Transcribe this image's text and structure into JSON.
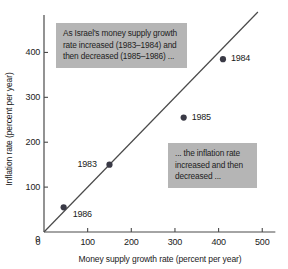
{
  "chart_data": {
    "type": "scatter",
    "title": "",
    "xlabel": "Money supply growth rate (percent per year)",
    "ylabel": "Inflation rate (percent per year)",
    "xlim": [
      0,
      530
    ],
    "ylim": [
      0,
      470
    ],
    "xticks": [
      "0",
      "100",
      "200",
      "300",
      "400",
      "500"
    ],
    "xtick_values": [
      0,
      100,
      200,
      300,
      400,
      500
    ],
    "yticks": [
      "0",
      "100",
      "200",
      "300",
      "400"
    ],
    "ytick_values": [
      0,
      100,
      200,
      300,
      400
    ],
    "grid": false,
    "legend": "none",
    "reference_line": {
      "name": "45-degree line",
      "from": [
        0,
        0
      ],
      "to": [
        490,
        490
      ]
    },
    "points": [
      {
        "label": "1986",
        "x": 45,
        "y": 55,
        "label_dx": 9,
        "label_dy": 8
      },
      {
        "label": "1983",
        "x": 150,
        "y": 150,
        "label_dx": -32,
        "label_dy": 0
      },
      {
        "label": "1985",
        "x": 320,
        "y": 255,
        "label_dx": 8,
        "label_dy": 0
      },
      {
        "label": "1984",
        "x": 410,
        "y": 385,
        "label_dx": 8,
        "label_dy": 0
      }
    ],
    "annotations": [
      {
        "name": "callout-money-supply",
        "text": "As Israel's money supply growth rate increased (1983–1984) and then decreased (1985–1986) ..."
      },
      {
        "name": "callout-inflation",
        "text": "... the inflation rate increased and then decreased ..."
      }
    ],
    "colors": {
      "background": "#ffffff",
      "axis": "#4a4a4a",
      "point": "#3a3a46",
      "line": "#4a4a4a",
      "callout_background": "#b5b5b5",
      "text": "#1a1a1a"
    }
  },
  "axes": {
    "x_title": "Money supply growth rate (percent per year)",
    "y_title": "Inflation rate (percent per year)"
  },
  "callouts": {
    "money_supply": "As Israel's money supply growth rate increased (1983–1984) and then decreased (1985–1986) ...",
    "inflation": "... the inflation rate increased and then decreased ..."
  },
  "ticks": {
    "x": [
      "0",
      "100",
      "200",
      "300",
      "400",
      "500"
    ],
    "y": [
      "0",
      "100",
      "200",
      "300",
      "400"
    ]
  },
  "points": [
    {
      "label": "1986"
    },
    {
      "label": "1983"
    },
    {
      "label": "1985"
    },
    {
      "label": "1984"
    }
  ]
}
